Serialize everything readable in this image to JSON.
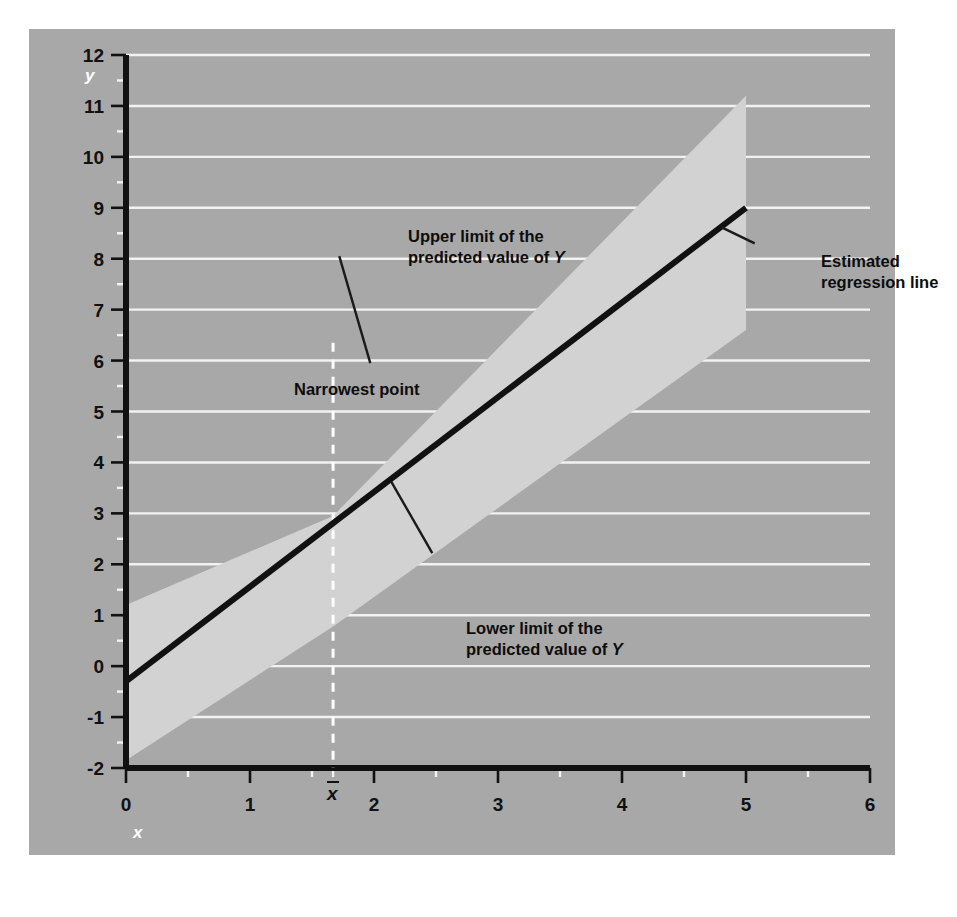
{
  "figure": {
    "panel_color": "#a8a8a8",
    "band_color": "#d2d2d2",
    "gridline_color": "#f2f2f2",
    "axis_color": "#111111",
    "axis_label_color": "#ffffff"
  },
  "axes": {
    "y": {
      "name": "y",
      "min": -2,
      "max": 12,
      "major_ticks": [
        -2,
        -1,
        0,
        1,
        2,
        3,
        4,
        5,
        6,
        7,
        8,
        9,
        10,
        11,
        12
      ],
      "tick_labels": [
        "-2",
        "-1",
        "0",
        "1",
        "2",
        "3",
        "4",
        "5",
        "6",
        "7",
        "8",
        "9",
        "10",
        "11",
        "12"
      ],
      "minor_step": 0.5
    },
    "x": {
      "name": "x",
      "min": 0,
      "max": 6,
      "major_ticks": [
        0,
        1,
        2,
        3,
        4,
        5,
        6
      ],
      "tick_labels": [
        "0",
        "1",
        "2",
        "3",
        "4",
        "5",
        "6"
      ],
      "minor_step": 0.5,
      "special_tick": {
        "value": 1.67,
        "label": "x",
        "overbar": true
      }
    }
  },
  "annotations": [
    {
      "id": "annot-upper",
      "lines": [
        "Upper limit of the",
        "predicted value of <i>Y</i>"
      ],
      "text": "Upper limit of the predicted value of Y",
      "leader": {
        "x1": 1.72,
        "y1": 8.05,
        "x2": 1.97,
        "y2": 5.95
      }
    },
    {
      "id": "annot-lower",
      "lines": [
        "Lower limit of the",
        "predicted value of <i>Y</i>"
      ],
      "text": "Lower limit of the predicted value of Y",
      "leader": {
        "x1": 2.14,
        "y1": 3.62,
        "x2": 2.47,
        "y2": 2.22
      }
    },
    {
      "id": "annot-line",
      "lines": [
        "Estimated",
        "regression line"
      ],
      "text": "Estimated regression line",
      "leader": {
        "x1": 5.07,
        "y1": 8.3,
        "x2": 4.8,
        "y2": 8.62
      }
    },
    {
      "id": "annot-narrow",
      "lines": [
        "Narrowest point"
      ],
      "text": "Narrowest point",
      "marker": {
        "x": 1.67,
        "y_top": 6.35,
        "y_bottom": -2,
        "style": "dashed",
        "color": "#ffffff"
      }
    }
  ],
  "chart_data": {
    "type": "line",
    "title": "",
    "xlabel": "x",
    "ylabel": "y",
    "xlim": [
      0,
      6
    ],
    "ylim": [
      -2,
      12
    ],
    "grid": true,
    "legend": "none",
    "series": [
      {
        "name": "Estimated regression line",
        "x": [
          0,
          5
        ],
        "values": [
          -0.3,
          9.0
        ],
        "intercept": -0.3,
        "slope": 1.86,
        "style": "solid",
        "color": "#111111",
        "width_px": 6
      },
      {
        "name": "Upper limit of the predicted value of Y",
        "x": [
          0,
          1.67,
          5
        ],
        "values": [
          1.2,
          2.95,
          11.2
        ],
        "style": "band-edge",
        "color": "#d2d2d2"
      },
      {
        "name": "Lower limit of the predicted value of Y",
        "x": [
          0,
          1.67,
          5
        ],
        "values": [
          -1.85,
          0.78,
          6.6
        ],
        "style": "band-edge",
        "color": "#d2d2d2"
      }
    ],
    "band": {
      "name": "Prediction interval band",
      "fill": "#d2d2d2",
      "narrowest_at_x": 1.67,
      "right_edge_x": 5,
      "upper": [
        [
          0,
          1.2
        ],
        [
          1.67,
          2.95
        ],
        [
          5,
          11.2
        ]
      ],
      "lower": [
        [
          0,
          -1.85
        ],
        [
          1.67,
          0.78
        ],
        [
          5,
          6.6
        ]
      ]
    }
  }
}
